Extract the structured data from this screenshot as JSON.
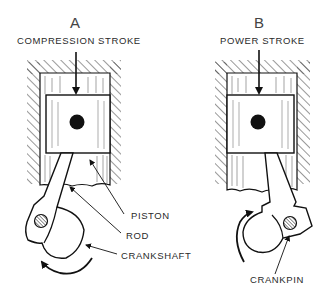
{
  "diagram": {
    "type": "engine-stroke-illustration",
    "panels": [
      {
        "id": "A",
        "letter": "A",
        "title": "COMPRESSION STROKE",
        "force_arrow": "down",
        "rotation_arrow": "counterclockwise-bottom",
        "labels": [
          "PISTON",
          "ROD",
          "CRANKSHAFT"
        ]
      },
      {
        "id": "B",
        "letter": "B",
        "title": "POWER STROKE",
        "force_arrow": "down",
        "rotation_arrow": "clockwise-left",
        "labels": [
          "CRANKPIN"
        ]
      }
    ],
    "callouts": {
      "piston": "PISTON",
      "rod": "ROD",
      "crankshaft": "CRANKSHAFT",
      "crankpin": "CRANKPIN"
    },
    "colors": {
      "line": "#111111",
      "text": "#2a2a2a",
      "background": "#ffffff"
    }
  }
}
